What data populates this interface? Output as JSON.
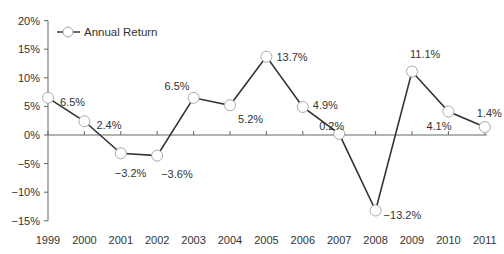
{
  "chart_data": {
    "type": "line",
    "title": "",
    "xlabel": "",
    "ylabel": "",
    "x": [
      "1999",
      "2000",
      "2001",
      "2002",
      "2003",
      "2004",
      "2005",
      "2006",
      "2007",
      "2008",
      "2009",
      "2010",
      "2011"
    ],
    "series": [
      {
        "name": "Annual Return",
        "values": [
          6.5,
          2.4,
          -3.2,
          -3.6,
          6.5,
          5.2,
          13.7,
          4.9,
          0.2,
          -13.2,
          11.1,
          4.1,
          1.4
        ],
        "labels": [
          "6.5%",
          "2.4%",
          "−3.2%",
          "−3.6%",
          "6.5%",
          "5.2%",
          "13.7%",
          "4.9%",
          "0.2%",
          "−13.2%",
          "11.1%",
          "4.1%",
          "1.4%"
        ]
      }
    ],
    "yticks": [
      20,
      15,
      10,
      5,
      0,
      -5,
      -10,
      -15
    ],
    "ytick_labels": [
      "20%",
      "15%",
      "10%",
      "5%",
      "0%",
      "−5%",
      "−10%",
      "−15%"
    ],
    "ylim": [
      -15,
      20
    ],
    "grid": false,
    "legend_position": "top-left",
    "colors": {
      "line": "#333333",
      "marker_fill": "#ffffff",
      "marker_stroke": "#aaaaaa",
      "axis": "#666666"
    }
  },
  "legend": {
    "label": "Annual Return"
  }
}
